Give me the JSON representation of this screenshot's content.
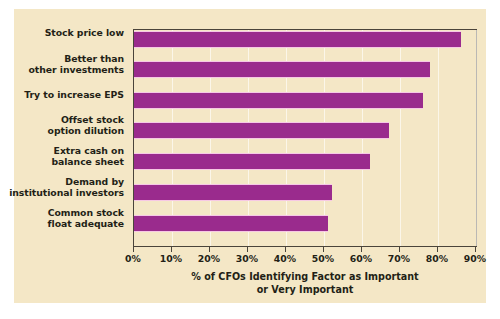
{
  "chart_data": {
    "type": "bar",
    "orientation": "horizontal",
    "title": "",
    "xlabel": "% of CFOs Identifying Factor as Important or Very Important",
    "xlabel_lines": [
      "% of CFOs Identifying Factor as Important",
      "or Very Important"
    ],
    "ylabel": "",
    "categories": [
      "Stock price low",
      "Better than other investments",
      "Try to increase EPS",
      "Offset stock option dilution",
      "Extra cash on balance sheet",
      "Demand by institutional investors",
      "Common stock float adequate"
    ],
    "category_lines": [
      [
        "Stock price low"
      ],
      [
        "Better than",
        "other investments"
      ],
      [
        "Try to increase EPS"
      ],
      [
        "Offset stock",
        "option dilution"
      ],
      [
        "Extra cash on",
        "balance sheet"
      ],
      [
        "Demand by",
        "institutional investors"
      ],
      [
        "Common stock",
        "float adequate"
      ]
    ],
    "values": [
      86,
      78,
      76,
      67,
      62,
      52,
      51
    ],
    "xlim": [
      0,
      90
    ],
    "xticks": [
      0,
      10,
      20,
      30,
      40,
      50,
      60,
      70,
      80,
      90
    ],
    "xtick_labels": [
      "0%",
      "10%",
      "20%",
      "30%",
      "40%",
      "50%",
      "60%",
      "70%",
      "80%",
      "90%"
    ],
    "grid": true,
    "legend": false,
    "colors": {
      "bar": "#9a2b8d",
      "bar_highlight": "#f6c9e6",
      "figure_background": "#f4e7c6",
      "page_background": "#ffffff",
      "axis": "#4a443a",
      "text": "#231f16",
      "gridline": "#ffffff"
    }
  }
}
